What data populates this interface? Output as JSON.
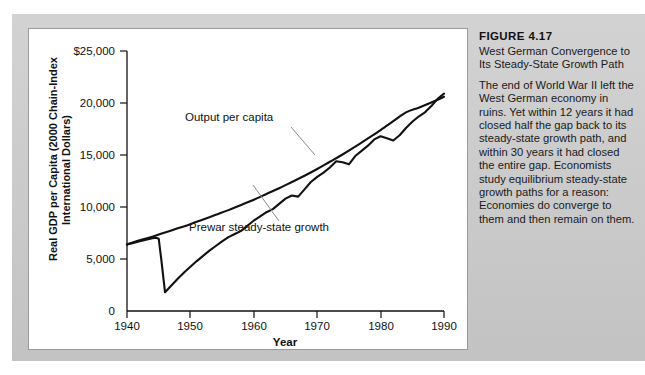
{
  "figure": {
    "caption_title": "FIGURE 4.17",
    "caption_subtitle": "West German Convergence to Its Steady-State Growth Path",
    "caption_body": "The end of World War II left the West German economy in ruins. Yet within 12 years it had closed half the gap back to its steady-state growth path, and within 30 years it had closed the entire gap. Economists study equilibrium steady-state growth paths for a reason: Economies do converge to them and then remain on them."
  },
  "chart_data": {
    "type": "line",
    "title": "West German Convergence to Its Steady-State Growth Path",
    "xlabel": "Year",
    "ylabel": "Real GDP per Capita (2000 Chain-Index International Dollars)",
    "xlim": [
      1940,
      1990
    ],
    "ylim": [
      0,
      25000
    ],
    "grid": false,
    "legend": "inline-annotations",
    "xticks": [
      1940,
      1950,
      1960,
      1970,
      1980,
      1990
    ],
    "xticklabels": [
      "1940",
      "1950",
      "1960",
      "1970",
      "1980",
      "1990"
    ],
    "yticks": [
      0,
      5000,
      10000,
      15000,
      20000,
      25000
    ],
    "yticklabels": [
      "0",
      "5,000",
      "10,000",
      "15,000",
      "20,000",
      "$25,000"
    ],
    "series": [
      {
        "name": "Output per capita",
        "label_text": "Output per capita",
        "color": "#111111",
        "x": [
          1940,
          1941,
          1942,
          1943,
          1944,
          1944.6,
          1945,
          1945.4,
          1946,
          1947,
          1948,
          1949,
          1950,
          1951,
          1952,
          1953,
          1954,
          1955,
          1956,
          1957,
          1958,
          1959,
          1960,
          1961,
          1962,
          1963,
          1964,
          1965,
          1966,
          1967,
          1968,
          1969,
          1970,
          1971,
          1972,
          1973,
          1974,
          1975,
          1976,
          1977,
          1978,
          1979,
          1980,
          1981,
          1982,
          1983,
          1984,
          1985,
          1986,
          1987,
          1988,
          1989,
          1990
        ],
        "y": [
          6400,
          6550,
          6700,
          6850,
          7000,
          7050,
          6950,
          5000,
          1800,
          2450,
          3100,
          3700,
          4250,
          4800,
          5300,
          5800,
          6250,
          6700,
          7100,
          7400,
          7700,
          8200,
          8700,
          9100,
          9500,
          9800,
          10300,
          10800,
          11100,
          11000,
          11700,
          12400,
          12900,
          13300,
          13800,
          14400,
          14300,
          14100,
          14900,
          15400,
          15900,
          16500,
          16800,
          16600,
          16400,
          16900,
          17600,
          18200,
          18700,
          19100,
          19700,
          20400,
          20900
        ]
      },
      {
        "name": "Prewar steady-state growth",
        "label_text": "Prewar steady-state growth",
        "color": "#111111",
        "x": [
          1940,
          1942,
          1944,
          1946,
          1948,
          1950,
          1952,
          1954,
          1956,
          1958,
          1960,
          1962,
          1964,
          1966,
          1968,
          1970,
          1972,
          1974,
          1976,
          1978,
          1980,
          1982,
          1984,
          1986,
          1988,
          1990
        ],
        "y": [
          6400,
          6800,
          7150,
          7550,
          7950,
          8350,
          8800,
          9250,
          9700,
          10200,
          10700,
          11250,
          11800,
          12400,
          13000,
          13650,
          14350,
          15050,
          15800,
          16600,
          17400,
          18250,
          19100,
          19550,
          20050,
          20600
        ]
      }
    ],
    "annotations": [
      {
        "text": "Output per capita",
        "x_px": 282,
        "y_px": 116
      },
      {
        "text": "Prewar steady-state growth",
        "x_px": 288,
        "y_px": 188
      }
    ]
  }
}
